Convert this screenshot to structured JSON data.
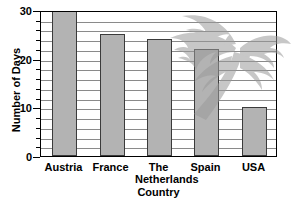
{
  "chart_data": {
    "type": "bar",
    "title": "",
    "xlabel": "Country",
    "ylabel": "Number of Days",
    "categories": [
      "Austria",
      "France",
      "The\nNetherlands",
      "Spain",
      "USA"
    ],
    "values": [
      30,
      25,
      24,
      22,
      10
    ],
    "ylim": [
      0,
      30
    ],
    "ytick_labels": [
      "0",
      "10",
      "20",
      "30"
    ],
    "ytick_values": [
      0,
      10,
      20,
      30
    ],
    "yminor_step": 2,
    "grid": true,
    "legend": null,
    "bar_color": "#b3b3b3",
    "bar_border_color": "#3b3b3b",
    "grid_color": "#8a8a8a",
    "axis_color": "#000000"
  },
  "overlay": {
    "watermark_name": "palm-tree-watermark",
    "watermark_color": "#9a9a9a"
  }
}
